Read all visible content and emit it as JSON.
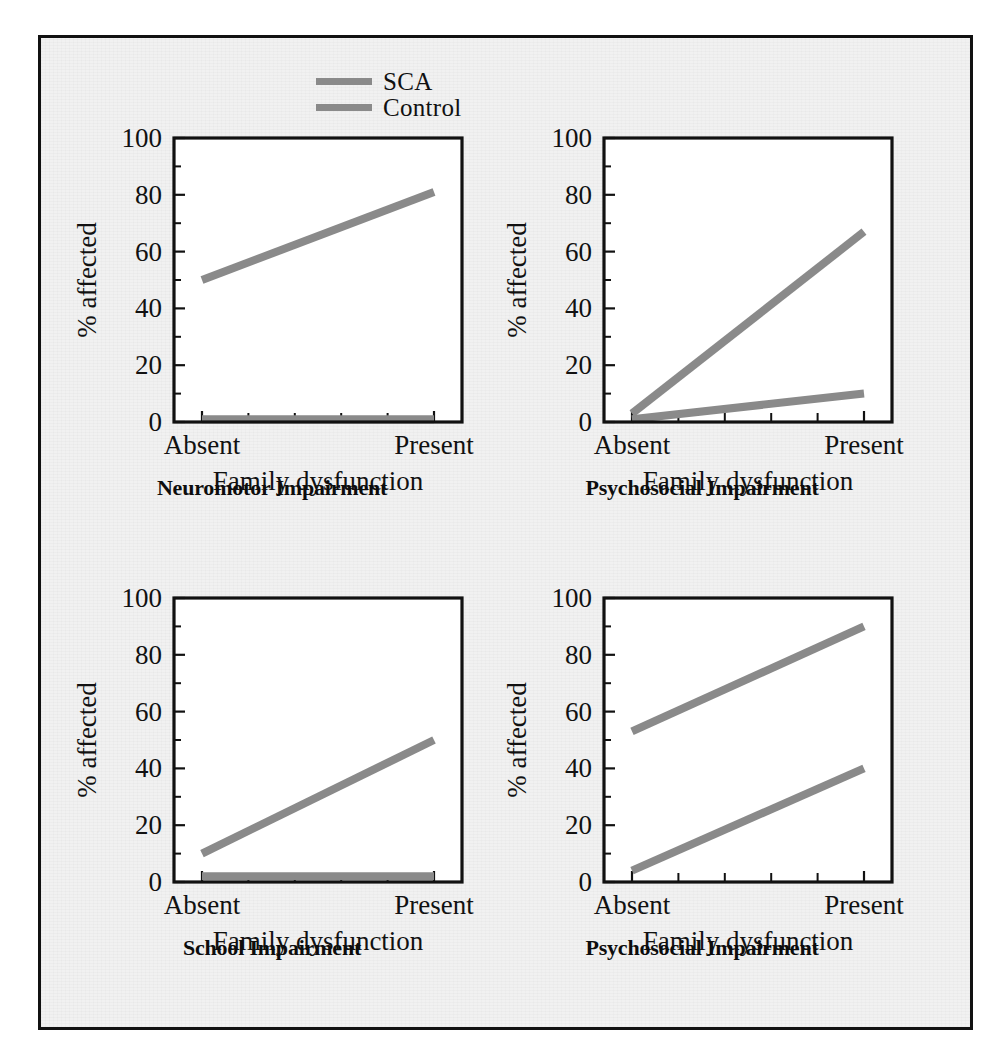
{
  "figure": {
    "background_color": "#f1f1f1",
    "frame_color": "#111111",
    "line_color": "#8a8a8a",
    "legend": {
      "entries": [
        {
          "label": "SCA",
          "color": "#8a8a8a"
        },
        {
          "label": "Control",
          "color": "#8a8a8a"
        }
      ]
    }
  },
  "chart_data": [
    {
      "type": "line",
      "title": "Neuromotor Impairment",
      "xlabel": "Family  dysfunction",
      "ylabel": "% affected",
      "categories": [
        "Absent",
        "Present"
      ],
      "xticklabels": [
        "Absent",
        "Present"
      ],
      "yticks": [
        0,
        20,
        40,
        60,
        80,
        100
      ],
      "yminorticks": [
        10,
        30,
        50,
        70,
        90
      ],
      "ylim": [
        0,
        100
      ],
      "grid": false,
      "legend_position": "figure-top-center",
      "series": [
        {
          "name": "SCA",
          "values": [
            50,
            81
          ],
          "color": "#8a8a8a"
        },
        {
          "name": "Control",
          "values": [
            1,
            1
          ],
          "color": "#8a8a8a"
        }
      ]
    },
    {
      "type": "line",
      "title": "Psychosocial Impairment",
      "xlabel": "Family  dysfunction",
      "ylabel": "% affected",
      "categories": [
        "Absent",
        "Present"
      ],
      "xticklabels": [
        "Absent",
        "Present"
      ],
      "yticks": [
        0,
        20,
        40,
        60,
        80,
        100
      ],
      "yminorticks": [
        10,
        30,
        50,
        70,
        90
      ],
      "ylim": [
        0,
        100
      ],
      "grid": false,
      "legend_position": "figure-top-center",
      "series": [
        {
          "name": "SCA",
          "values": [
            3,
            67
          ],
          "color": "#8a8a8a"
        },
        {
          "name": "Control",
          "values": [
            1,
            10
          ],
          "color": "#8a8a8a"
        }
      ]
    },
    {
      "type": "line",
      "title": "School Impairment",
      "xlabel": "Family  dysfunction",
      "ylabel": "% affected",
      "categories": [
        "Absent",
        "Present"
      ],
      "xticklabels": [
        "Absent",
        "Present"
      ],
      "yticks": [
        0,
        20,
        40,
        60,
        80,
        100
      ],
      "yminorticks": [
        10,
        30,
        50,
        70,
        90
      ],
      "ylim": [
        0,
        100
      ],
      "grid": false,
      "legend_position": "figure-top-center",
      "series": [
        {
          "name": "SCA",
          "values": [
            10,
            50
          ],
          "color": "#8a8a8a"
        },
        {
          "name": "Control",
          "values": [
            2,
            2
          ],
          "color": "#8a8a8a"
        }
      ]
    },
    {
      "type": "line",
      "title": "Psychosocial Impairment",
      "xlabel": "Family  dysfunction",
      "ylabel": "% affected",
      "categories": [
        "Absent",
        "Present"
      ],
      "xticklabels": [
        "Absent",
        "Present"
      ],
      "yticks": [
        0,
        20,
        40,
        60,
        80,
        100
      ],
      "yminorticks": [
        10,
        30,
        50,
        70,
        90
      ],
      "ylim": [
        0,
        100
      ],
      "grid": false,
      "legend_position": "figure-top-center",
      "series": [
        {
          "name": "SCA",
          "values": [
            53,
            90
          ],
          "color": "#8a8a8a"
        },
        {
          "name": "Control",
          "values": [
            4,
            40
          ],
          "color": "#8a8a8a"
        }
      ]
    }
  ]
}
